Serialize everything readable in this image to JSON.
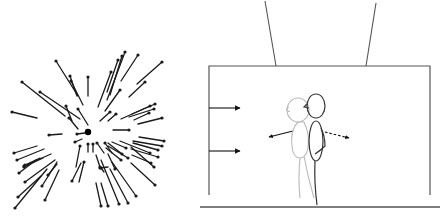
{
  "figure": {
    "panels": [
      {
        "id": "left",
        "description": "Radial optic-flow vector field expanding from a central focus point",
        "focus_point": {
          "x": 88,
          "y": 132,
          "r": 3.2
        },
        "line_color": "#1a1a1a",
        "vectors": [
          [
            56,
            61,
            78,
            96
          ],
          [
            71,
            81,
            83,
            105
          ],
          [
            70,
            76,
            77,
            96
          ],
          [
            88,
            77,
            88,
            96
          ],
          [
            22,
            82,
            65,
            116
          ],
          [
            40,
            92,
            80,
            119
          ],
          [
            12,
            112,
            37,
            118
          ],
          [
            66,
            106,
            72,
            121
          ],
          [
            78,
            109,
            88,
            125
          ],
          [
            69,
            118,
            78,
            129
          ],
          [
            125,
            52,
            107,
            100
          ],
          [
            122,
            56,
            110,
            95
          ],
          [
            118,
            60,
            107,
            92
          ],
          [
            111,
            72,
            98,
            107
          ],
          [
            138,
            55,
            121,
            81
          ],
          [
            162,
            62,
            137,
            84
          ],
          [
            145,
            82,
            129,
            97
          ],
          [
            120,
            90,
            105,
            111
          ],
          [
            110,
            112,
            100,
            121
          ],
          [
            116,
            114,
            108,
            121
          ],
          [
            150,
            106,
            121,
            119
          ],
          [
            155,
            104,
            132,
            114
          ],
          [
            154,
            109,
            129,
            117
          ],
          [
            149,
            113,
            134,
            120
          ],
          [
            162,
            118,
            138,
            124
          ],
          [
            129,
            130,
            113,
            130
          ],
          [
            49,
            135,
            62,
            134
          ],
          [
            77,
            134,
            85,
            133
          ],
          [
            75,
            142,
            82,
            139
          ],
          [
            164,
            141,
            139,
            137
          ],
          [
            162,
            146,
            133,
            141
          ],
          [
            158,
            150,
            133,
            143
          ],
          [
            150,
            153,
            120,
            141
          ],
          [
            126,
            148,
            112,
            142
          ],
          [
            122,
            154,
            108,
            143
          ],
          [
            158,
            157,
            131,
            149
          ],
          [
            151,
            163,
            132,
            155
          ],
          [
            128,
            158,
            108,
            146
          ],
          [
            121,
            160,
            106,
            148
          ],
          [
            88,
            144,
            88,
            152
          ],
          [
            93,
            144,
            93,
            152
          ],
          [
            97,
            143,
            104,
            153
          ],
          [
            105,
            143,
            112,
            153
          ],
          [
            80,
            146,
            76,
            167
          ],
          [
            14,
            153,
            37,
            146
          ],
          [
            17,
            160,
            44,
            149
          ],
          [
            24,
            166,
            51,
            154
          ],
          [
            24,
            167,
            43,
            158
          ],
          [
            25,
            165,
            40,
            158
          ],
          [
            19,
            173,
            36,
            160
          ],
          [
            25,
            182,
            55,
            160
          ],
          [
            72,
            181,
            81,
            163
          ],
          [
            42,
            186,
            57,
            162
          ],
          [
            48,
            175,
            57,
            164
          ],
          [
            45,
            200,
            59,
            170
          ],
          [
            15,
            208,
            47,
            169
          ],
          [
            18,
            197,
            41,
            176
          ],
          [
            84,
            162,
            79,
            182
          ],
          [
            100,
            167,
            96,
            155
          ],
          [
            101,
            168,
            104,
            172
          ],
          [
            100,
            168,
            108,
            167
          ],
          [
            154,
            167,
            131,
            147
          ],
          [
            155,
            185,
            131,
            163
          ],
          [
            136,
            196,
            112,
            162
          ],
          [
            128,
            203,
            110,
            169
          ],
          [
            119,
            204,
            101,
            160
          ],
          [
            101,
            206,
            96,
            183
          ],
          [
            108,
            206,
            101,
            183
          ],
          [
            115,
            169,
            108,
            154
          ]
        ]
      },
      {
        "id": "right",
        "description": "Room scene with suspended box, two overlapping standing figures, wind arrows and motion arrows",
        "stroke_color": "#555555",
        "arrow_color": "#111111",
        "room": {
          "x": 9,
          "y": 66,
          "w": 221,
          "h": 129
        },
        "suspension_cables": [
          [
            65,
            1,
            76,
            66
          ],
          [
            176,
            3,
            166,
            66
          ]
        ],
        "floor_y": 207,
        "wind_arrows": [
          [
            9,
            108,
            40,
            108
          ],
          [
            9,
            151,
            40,
            151
          ]
        ],
        "motion_arrows": [
          {
            "type": "solid",
            "from": [
              93,
              131
            ],
            "to": [
              69,
              137
            ]
          },
          {
            "type": "dashed",
            "from": [
              125,
              132
            ],
            "to": [
              149,
              138
            ]
          }
        ],
        "figures": [
          {
            "id": "faded-figure",
            "color": "#b9b9b9"
          },
          {
            "id": "dark-figure",
            "color": "#333333"
          }
        ]
      }
    ]
  }
}
